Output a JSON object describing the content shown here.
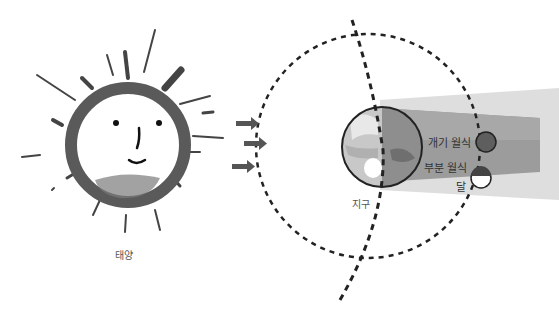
{
  "figure": {
    "title_partial": "",
    "sun": {
      "label": "태양"
    },
    "earth": {
      "label": "지구"
    },
    "moon": {
      "label": "달"
    },
    "eclipse": {
      "total_label": "개기 월식",
      "partial_label": "부분 월식"
    },
    "colors": {
      "ink": "#222222",
      "sun_ring": "#5a5a5a",
      "shadow_umbra": "#9a9a9a",
      "shadow_penumbra": "#d8d8d8",
      "arrow": "#555555"
    }
  }
}
